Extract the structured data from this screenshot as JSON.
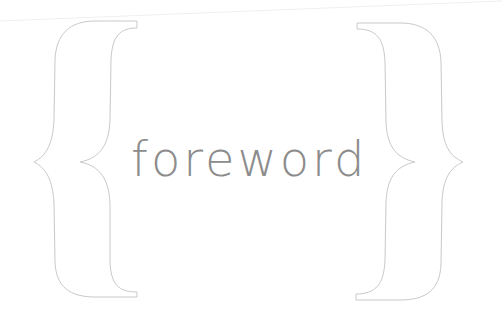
{
  "page": {
    "heading": "foreword"
  },
  "decoration": {
    "left_brace": "left-curly-brace-outline",
    "right_brace": "right-curly-brace-outline",
    "line_color": "#c8c8c8",
    "text_color": "#8c8c8c",
    "background": "#ffffff"
  }
}
